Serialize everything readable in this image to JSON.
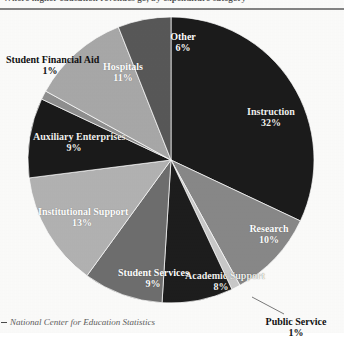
{
  "document": {
    "cropped_title": "Where higher education revenues go, by expenditure category",
    "source_prefix": "–",
    "source": "National Center for Education Statistics"
  },
  "chart_data": {
    "type": "pie",
    "title": "",
    "xlabel": "",
    "ylabel": "",
    "start_angle_deg": 0,
    "direction": "clockwise",
    "legend": "none",
    "grid": false,
    "units": "percent",
    "categories": [
      "Instruction",
      "Research",
      "Public Service",
      "Academic Support",
      "Student Services",
      "Institutional Support",
      "Auxiliary Enterprises",
      "Student Financial Aid",
      "Hospitals",
      "Other"
    ],
    "values": [
      32,
      10,
      1,
      8,
      9,
      13,
      9,
      1,
      11,
      6
    ],
    "colors": [
      "#1b1b1b",
      "#888888",
      "#c9c9c9",
      "#1d1d1d",
      "#6e6e6e",
      "#b2b2b2",
      "#1a1a1a",
      "#8f8f8f",
      "#a8a8a8",
      "#585858"
    ],
    "slices": [
      {
        "label": "Instruction",
        "value": 32,
        "display": "32%",
        "color": "#1b1b1b",
        "text_on": "dark"
      },
      {
        "label": "Research",
        "value": 10,
        "display": "10%",
        "color": "#888888",
        "text_on": "light"
      },
      {
        "label": "Public Service",
        "value": 1,
        "display": "1%",
        "color": "#c9c9c9",
        "text_on": "page"
      },
      {
        "label": "Academic Support",
        "value": 8,
        "display": "8%",
        "color": "#1d1d1d",
        "text_on": "dark"
      },
      {
        "label": "Student Services",
        "value": 9,
        "display": "9%",
        "color": "#6e6e6e",
        "text_on": "light"
      },
      {
        "label": "Institutional Support",
        "value": 13,
        "display": "13%",
        "color": "#b2b2b2",
        "text_on": "light"
      },
      {
        "label": "Auxiliary Enterprises",
        "value": 9,
        "display": "9%",
        "color": "#1a1a1a",
        "text_on": "dark"
      },
      {
        "label": "Student Financial Aid",
        "value": 1,
        "display": "1%",
        "color": "#8f8f8f",
        "text_on": "page"
      },
      {
        "label": "Hospitals",
        "value": 11,
        "display": "11%",
        "color": "#a8a8a8",
        "text_on": "light"
      },
      {
        "label": "Other",
        "value": 6,
        "display": "6%",
        "color": "#585858",
        "text_on": "light"
      }
    ]
  },
  "labels": {
    "instruction": {
      "name": "Instruction",
      "value": "32%"
    },
    "research": {
      "name": "Research",
      "value": "10%"
    },
    "public_service": {
      "name": "Public Service",
      "value": "1%"
    },
    "academic_support": {
      "name": "Academic Support",
      "value": "8%"
    },
    "student_services": {
      "name": "Student Services",
      "value": "9%"
    },
    "institutional": {
      "name": "Institutional Support",
      "value": "13%"
    },
    "auxiliary": {
      "name": "Auxiliary Enterprises",
      "value": "9%"
    },
    "financial_aid": {
      "name": "Student Financial Aid",
      "value": "1%"
    },
    "hospitals": {
      "name": "Hospitals",
      "value": "11%"
    },
    "other": {
      "name": "Other",
      "value": "6%"
    }
  }
}
